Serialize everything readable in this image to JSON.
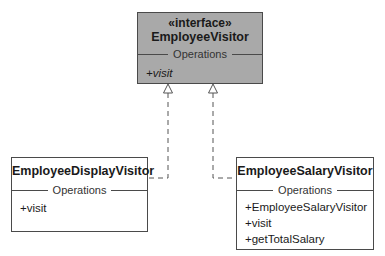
{
  "diagram": {
    "type": "uml-class-diagram",
    "interface": {
      "stereotype": "«interface»",
      "name": "EmployeeVisitor",
      "section_label": "Operations",
      "operations": [
        "+visit"
      ]
    },
    "classes": [
      {
        "name": "EmployeeDisplayVisitor",
        "section_label": "Operations",
        "operations": [
          "+visit"
        ]
      },
      {
        "name": "EmployeeSalaryVisitor",
        "section_label": "Operations",
        "operations": [
          "+EmployeeSalaryVisitor",
          "+visit",
          "+getTotalSalary"
        ]
      }
    ],
    "relationships": [
      {
        "from": "EmployeeDisplayVisitor",
        "to": "EmployeeVisitor",
        "kind": "realization"
      },
      {
        "from": "EmployeeSalaryVisitor",
        "to": "EmployeeVisitor",
        "kind": "realization"
      }
    ],
    "colors": {
      "interface_fill": "#a9a9a9",
      "class_fill": "#ffffff",
      "line": "#4a4a4a"
    }
  }
}
